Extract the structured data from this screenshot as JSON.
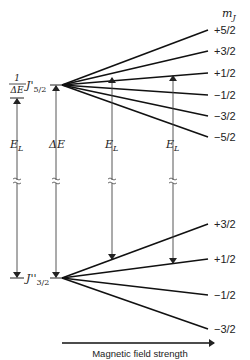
{
  "diagram": {
    "type": "zeeman-splitting-energy-level",
    "column_header": "m",
    "column_header_sub": "J",
    "upper_level": {
      "label": "J'",
      "label_sub": "5/2",
      "y": 85,
      "mj_values": [
        "+5/2",
        "+3/2",
        "+1/2",
        "−1/2",
        "−3/2",
        "−5/2"
      ],
      "end_y": [
        30,
        51,
        73,
        95,
        116,
        137
      ]
    },
    "lower_level": {
      "label": "J''",
      "label_sub": "3/2",
      "y": 278,
      "mj_values": [
        "+3/2",
        "+1/2",
        "−1/2",
        "−3/2"
      ],
      "end_y": [
        224,
        259,
        295,
        329
      ]
    },
    "annotations": {
      "inverse_delta_e_num": "1",
      "inverse_delta_e_den": "ΔE",
      "delta_e": "ΔE",
      "e_l": "E",
      "e_l_sub": "L"
    },
    "x_axis_label": "Magnetic field strength"
  }
}
